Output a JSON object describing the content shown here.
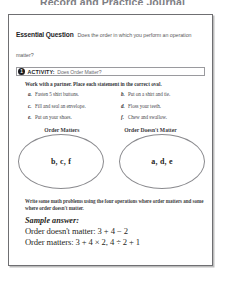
{
  "page": {
    "header_title": "Record and Practice Journal"
  },
  "essential_question": {
    "label": "Essential Question",
    "text": "Does the order in which you perform an operation matter?"
  },
  "activity": {
    "number": "1",
    "word": "ACTIVITY:",
    "title": "Does Order Matter?"
  },
  "directions": "Work with a partner. Place each statement in the correct oval.",
  "statements": [
    {
      "letter": "a.",
      "text": "Fasten 5 shirt buttons."
    },
    {
      "letter": "b.",
      "text": "Put on a shirt and tie."
    },
    {
      "letter": "c.",
      "text": "Fill and seal an envelope."
    },
    {
      "letter": "d.",
      "text": "Floss your teeth."
    },
    {
      "letter": "e.",
      "text": "Put on your shoes."
    },
    {
      "letter": "f.",
      "text": "Chew and swallow."
    }
  ],
  "ovals": [
    {
      "label": "Order Matters",
      "content": "b, c, f"
    },
    {
      "label": "Order Doesn't Matter",
      "content": "a, d, e"
    }
  ],
  "prompt": "Write some math problems using the four operations where order matters and some where order doesn't matter.",
  "sample_answer": {
    "heading": "Sample answer:",
    "lines": [
      "Order doesn't matter: 3 + 4 − 2",
      "Order matters: 3 + 4 × 2, 4 ÷ 2 + 1"
    ]
  },
  "colors": {
    "frame_border": "#6f6f72",
    "badge": "#1c1c20",
    "oval_stroke": "#8a8a8e",
    "header_gray": "#7d7d83"
  }
}
